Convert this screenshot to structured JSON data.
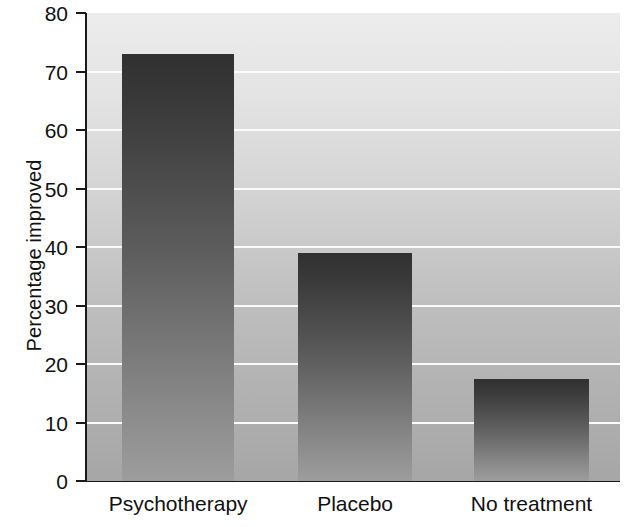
{
  "chart_data": {
    "type": "bar",
    "title": "",
    "xlabel": "",
    "ylabel": "Percentage improved",
    "categories": [
      "Psychotherapy",
      "Placebo",
      "No treatment"
    ],
    "values": [
      73,
      39,
      17.5
    ],
    "ylim": [
      0,
      80
    ],
    "yticks": [
      0,
      10,
      20,
      30,
      40,
      50,
      60,
      70,
      80
    ],
    "ytick_labels": [
      "0",
      "10",
      "20",
      "30",
      "40",
      "50",
      "60",
      "70",
      "80"
    ],
    "grid": true,
    "gridline_color": "#fbfbfb",
    "legend": null,
    "legend_position": "none",
    "series": [
      {
        "name": "Percentage improved",
        "values": [
          73,
          39,
          17.5
        ]
      }
    ],
    "style": {
      "plot_background_top_color": "#ececec",
      "plot_background_bottom_color": "#a6a6a6",
      "bar_top_color": "#303030",
      "bar_bottom_color": "#9d9d9d",
      "axis_color": "#1a1a1a",
      "text_color": "#111111",
      "page_background": "#ffffff"
    },
    "bar_geometry": [
      {
        "center_pct": 6.6,
        "width_pct": 21.0
      },
      {
        "center_pct": 39.6,
        "width_pct": 21.4
      },
      {
        "center_pct": 72.6,
        "width_pct": 21.6
      }
    ]
  }
}
